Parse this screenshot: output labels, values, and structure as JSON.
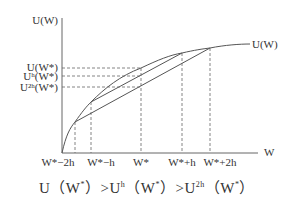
{
  "diagram": {
    "y_axis_label": "U(W)",
    "x_axis_label": "W",
    "curve_label": "U(W)",
    "y_ticks": [
      "U(W*)",
      "Uʰ(W*)",
      "U²ʰ(W*)"
    ],
    "x_ticks": [
      "W*−2h",
      "W*−h",
      "W*",
      "W*+h",
      "W*+2h"
    ],
    "caption": {
      "part1": "U（W",
      "sup1": "*",
      "part2": "）>U",
      "sup2": "h",
      "part3": "（W",
      "sup3": "*",
      "part4": "）>U",
      "sup4": "2h",
      "part5": "（W",
      "sup5": "*",
      "part6": "）"
    },
    "colors": {
      "line": "#555555",
      "text": "#333333"
    }
  }
}
